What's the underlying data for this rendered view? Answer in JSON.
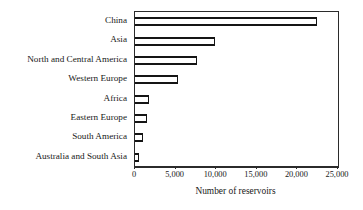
{
  "chart_data": {
    "type": "bar",
    "orientation": "horizontal",
    "title": "",
    "xlabel": "Number of reservoirs",
    "ylabel": "",
    "xlim": [
      0,
      25000
    ],
    "grid": false,
    "legend": null,
    "xticks": [
      "0",
      "5,000",
      "10,000",
      "15,000",
      "20,000",
      "25,000"
    ],
    "xtick_values": [
      0,
      5000,
      10000,
      15000,
      20000,
      25000
    ],
    "categories": [
      "China",
      "Asia",
      "North and Central America",
      "Western Europe",
      "Africa",
      "Eastern Europe",
      "South America",
      "Australia and South Asia"
    ],
    "values": [
      22400,
      9900,
      7600,
      5300,
      1700,
      1500,
      1000,
      500
    ]
  }
}
